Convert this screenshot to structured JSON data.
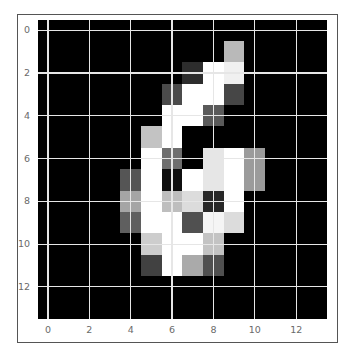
{
  "chart_data": {
    "type": "heatmap",
    "title": "",
    "xlabel": "",
    "ylabel": "",
    "colormap": "gray",
    "grid": true,
    "xlim": [
      -0.5,
      13.5
    ],
    "ylim": [
      13.5,
      -0.5
    ],
    "xticks": [
      0,
      2,
      4,
      6,
      8,
      10,
      12
    ],
    "yticks": [
      0,
      2,
      4,
      6,
      8,
      10,
      12
    ],
    "shape": [
      14,
      14
    ],
    "values": [
      [
        0,
        0,
        0,
        0,
        0,
        0,
        0,
        0,
        0,
        0,
        0,
        0,
        0,
        0
      ],
      [
        0,
        0,
        0,
        0,
        0,
        0,
        0,
        0,
        0,
        185,
        0,
        0,
        0,
        0
      ],
      [
        0,
        0,
        0,
        0,
        0,
        0,
        0,
        45,
        255,
        240,
        0,
        0,
        0,
        0
      ],
      [
        0,
        0,
        0,
        0,
        0,
        0,
        75,
        255,
        255,
        70,
        0,
        0,
        0,
        0
      ],
      [
        0,
        0,
        0,
        0,
        0,
        0,
        255,
        255,
        90,
        0,
        0,
        0,
        0,
        0
      ],
      [
        0,
        0,
        0,
        0,
        0,
        195,
        255,
        0,
        0,
        0,
        0,
        0,
        0,
        0
      ],
      [
        0,
        0,
        0,
        0,
        0,
        255,
        110,
        0,
        230,
        255,
        155,
        0,
        0,
        0
      ],
      [
        0,
        0,
        0,
        0,
        85,
        255,
        15,
        255,
        230,
        255,
        155,
        0,
        0,
        0
      ],
      [
        0,
        0,
        0,
        0,
        165,
        255,
        190,
        220,
        40,
        255,
        0,
        0,
        0,
        0
      ],
      [
        0,
        0,
        0,
        0,
        95,
        255,
        255,
        80,
        245,
        220,
        0,
        0,
        0,
        0
      ],
      [
        0,
        0,
        0,
        0,
        0,
        205,
        255,
        255,
        195,
        0,
        0,
        0,
        0,
        0
      ],
      [
        0,
        0,
        0,
        0,
        0,
        65,
        255,
        170,
        80,
        0,
        0,
        0,
        0,
        0
      ],
      [
        0,
        0,
        0,
        0,
        0,
        0,
        0,
        0,
        0,
        0,
        0,
        0,
        0,
        0
      ],
      [
        0,
        0,
        0,
        0,
        0,
        0,
        0,
        0,
        0,
        0,
        0,
        0,
        0,
        0
      ]
    ]
  },
  "axes": {
    "x_tick_labels": [
      "0",
      "2",
      "4",
      "6",
      "8",
      "10",
      "12"
    ],
    "y_tick_labels": [
      "0",
      "2",
      "4",
      "6",
      "8",
      "10",
      "12"
    ]
  },
  "colors": {
    "background": "#ffffff",
    "frame": "#555555",
    "gridline": "#e6e6e6",
    "tick_label": "#6a6a6a"
  }
}
